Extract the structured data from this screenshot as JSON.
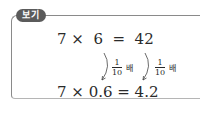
{
  "tag": {
    "label": "보기"
  },
  "example": {
    "line1": "7 ×  6  =  42",
    "line2": "7 × 0.6 = 4.2",
    "annotations": [
      {
        "numerator": "1",
        "denominator": "10",
        "suffix": "배"
      },
      {
        "numerator": "1",
        "denominator": "10",
        "suffix": "배"
      }
    ]
  }
}
